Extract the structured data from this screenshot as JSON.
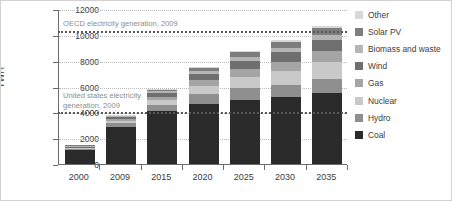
{
  "chart_data": {
    "type": "bar",
    "stacked": true,
    "title": "",
    "xlabel": "",
    "ylabel": "TWH",
    "ylim": [
      0,
      12000
    ],
    "ytick_values": [
      0,
      2000,
      4000,
      6000,
      8000,
      10000,
      12000
    ],
    "ytick_labels": [
      "0",
      "2000",
      "4000",
      "6000",
      "8000",
      "10000",
      "12000"
    ],
    "grid": true,
    "legend_position": "right",
    "categories": [
      "2000",
      "2009",
      "2015",
      "2020",
      "2025",
      "2030",
      "2035"
    ],
    "series": [
      {
        "name": "Coal",
        "color": "#2b2b2b",
        "values": [
          1050,
          2900,
          4100,
          4650,
          4950,
          5150,
          5500
        ]
      },
      {
        "name": "Hydro",
        "color": "#8f8f8f",
        "values": [
          90,
          300,
          500,
          750,
          900,
          1000,
          1100
        ]
      },
      {
        "name": "Nuclear",
        "color": "#c9c9c9",
        "values": [
          20,
          150,
          320,
          620,
          880,
          1050,
          1300
        ]
      },
      {
        "name": "Gas",
        "color": "#a5a5a5",
        "values": [
          20,
          160,
          300,
          480,
          620,
          720,
          820
        ]
      },
      {
        "name": "Wind",
        "color": "#6f6f6f",
        "values": [
          10,
          120,
          280,
          480,
          640,
          780,
          900
        ]
      },
      {
        "name": "Biomass and waste",
        "color": "#b5b5b5",
        "values": [
          5,
          60,
          130,
          200,
          260,
          300,
          350
        ]
      },
      {
        "name": "Solar PV",
        "color": "#7d7d7d",
        "values": [
          5,
          60,
          140,
          260,
          390,
          480,
          560
        ]
      },
      {
        "name": "Other",
        "color": "#d8d8d8",
        "values": [
          5,
          30,
          60,
          90,
          120,
          150,
          180
        ]
      }
    ],
    "reference_lines": [
      {
        "name": "OECD electricity generation, 2009",
        "value": 10400,
        "label": "OECD electricity generation, 2009"
      },
      {
        "name": "United states electricity generation, 2009",
        "value": 4100,
        "label": "United states electricity\ngeneration, 2009"
      }
    ],
    "legend_entries": [
      {
        "label": "Other",
        "color": "#d8d8d8"
      },
      {
        "label": "Solar PV",
        "color": "#7d7d7d"
      },
      {
        "label": "Biomass and waste",
        "color": "#b5b5b5"
      },
      {
        "label": "Wind",
        "color": "#6f6f6f"
      },
      {
        "label": "Gas",
        "color": "#a5a5a5"
      },
      {
        "label": "Nuclear",
        "color": "#c9c9c9"
      },
      {
        "label": "Hydro",
        "color": "#8f8f8f"
      },
      {
        "label": "Coal",
        "color": "#2b2b2b"
      }
    ]
  }
}
